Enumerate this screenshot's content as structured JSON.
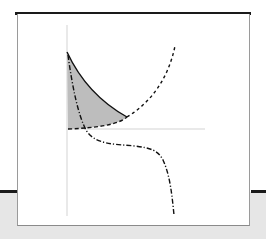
{
  "figure": {
    "colors": {
      "background": "#ffffff",
      "bottom_band": "#e6e6e6",
      "rule": "#1a1a1a",
      "axis": "#e0e0e0",
      "curve": "#111111",
      "shade": "#bdbdbd"
    },
    "axes": {
      "vertical": {
        "label": ""
      },
      "horizontal": {
        "label": ""
      }
    },
    "curves": [
      {
        "name": "solid-convex-curve",
        "style": "solid"
      },
      {
        "name": "dashed-u-curve",
        "style": "dashed"
      },
      {
        "name": "dash-dot-s-curve",
        "style": "dash-dot"
      }
    ],
    "shaded_region": {
      "name": "area-between-curves",
      "fill": "#bdbdbd"
    }
  }
}
